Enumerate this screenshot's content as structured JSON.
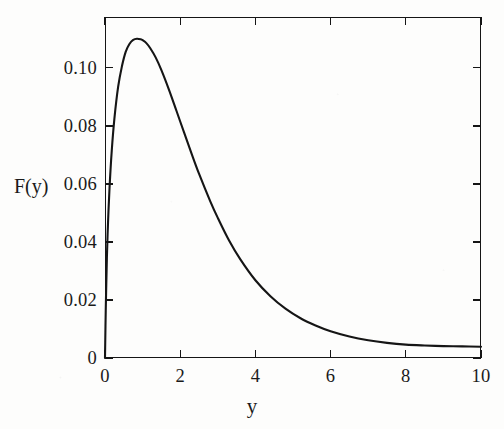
{
  "chart_data": {
    "type": "line",
    "title": "",
    "xlabel": "y",
    "ylabel": "F(y)",
    "xlim": [
      0,
      10
    ],
    "ylim": [
      0,
      0.1175
    ],
    "grid": false,
    "legend": null,
    "xticks": [
      0,
      2,
      4,
      6,
      8,
      10
    ],
    "xtick_labels": [
      "0",
      "2",
      "4",
      "6",
      "8",
      "10"
    ],
    "yticks": [
      0,
      0.02,
      0.04,
      0.06,
      0.08,
      0.1
    ],
    "ytick_labels": [
      "0",
      "0.02",
      "0.04",
      "0.06",
      "0.08",
      "0.10"
    ],
    "line_color": "#151515",
    "frame_color": "#151515",
    "series": [
      {
        "name": "F(y)",
        "x": [
          0.0,
          0.02,
          0.05,
          0.08,
          0.12,
          0.18,
          0.25,
          0.35,
          0.45,
          0.55,
          0.65,
          0.75,
          0.85,
          0.95,
          1.0,
          1.1,
          1.2,
          1.35,
          1.5,
          1.7,
          1.9,
          2.1,
          2.3,
          2.5,
          2.8,
          3.0,
          3.3,
          3.6,
          4.0,
          4.4,
          4.8,
          5.2,
          5.6,
          6.0,
          6.5,
          7.0,
          7.5,
          8.0,
          8.5,
          9.0,
          9.5,
          10.0
        ],
        "y": [
          0.0,
          0.0165,
          0.0345,
          0.0465,
          0.0585,
          0.0715,
          0.0825,
          0.0935,
          0.1005,
          0.1055,
          0.1082,
          0.1096,
          0.11,
          0.1098,
          0.1095,
          0.1085,
          0.1068,
          0.1035,
          0.0992,
          0.0925,
          0.0852,
          0.0778,
          0.0705,
          0.0635,
          0.054,
          0.0483,
          0.0405,
          0.034,
          0.0268,
          0.0213,
          0.017,
          0.0137,
          0.0112,
          0.0092,
          0.0074,
          0.0061,
          0.0052,
          0.0046,
          0.0043,
          0.0041,
          0.004,
          0.0039
        ]
      }
    ],
    "peak": {
      "x": 0.9,
      "y": 0.11
    },
    "annotations": []
  },
  "axes": {
    "y_title": "F(y)",
    "x_title": "y",
    "y_tick_labels": [
      "0.10",
      "0.08",
      "0.06",
      "0.04",
      "0.02",
      "0"
    ],
    "y_tick_values": [
      0.1,
      0.08,
      0.06,
      0.04,
      0.02,
      0
    ],
    "x_tick_labels": [
      "0",
      "2",
      "4",
      "6",
      "8",
      "10"
    ],
    "x_tick_values": [
      0,
      2,
      4,
      6,
      8,
      10
    ]
  }
}
